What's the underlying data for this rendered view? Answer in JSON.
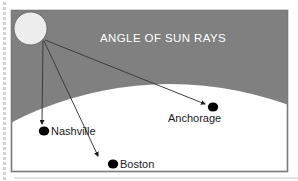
{
  "figure": {
    "title": "ANGLE OF SUN RAYS",
    "title_color": "#ffffff",
    "sky_color": "#808080",
    "earth_color": "#ffffff",
    "sun_color": "#ededed",
    "frame_color": "#7a7a7a",
    "ray_color": "#3c3c3c",
    "marker_color": "#000000",
    "label_color": "#1a1a1a",
    "margin_rule_color": "#d8d8d8"
  },
  "sun": {
    "name": "sun",
    "cx": 30.5,
    "cy": 28.5,
    "r": 16.5
  },
  "rays": [
    {
      "target": "Nashville",
      "x1": 43,
      "y1": 40,
      "x2": 42,
      "y2": 124
    },
    {
      "target": "Boston",
      "x1": 44,
      "y1": 41,
      "x2": 98,
      "y2": 156
    },
    {
      "target": "Anchorage",
      "x1": 45,
      "y1": 40,
      "x2": 205,
      "y2": 104
    }
  ],
  "cities": [
    {
      "name": "Nashville",
      "label": "Nashville",
      "dot_x": 44,
      "dot_y": 131,
      "label_x": 51,
      "label_y": 135
    },
    {
      "name": "Boston",
      "label": "Boston",
      "dot_x": 113,
      "dot_y": 164,
      "label_x": 120,
      "label_y": 168
    },
    {
      "name": "Anchorage",
      "label": "Anchorage",
      "dot_x": 213,
      "dot_y": 107,
      "label_x": 168,
      "label_y": 122
    }
  ],
  "title_pos": {
    "x": 100,
    "y": 42
  },
  "frame": {
    "x": 11,
    "y": 10,
    "w": 277,
    "h": 162
  },
  "bottom_rule": {
    "x1": 14,
    "y1": 178,
    "x2": 298,
    "y2": 178
  },
  "left_margin_dots": {
    "name": "left-margin-dotted-rule",
    "x": 3,
    "y_start": 2,
    "y_end": 180,
    "step": 5
  }
}
